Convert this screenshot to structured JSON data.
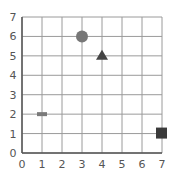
{
  "chart_data": {
    "type": "scatter",
    "title": "",
    "xlabel": "",
    "ylabel": "",
    "xlim": [
      0,
      7
    ],
    "ylim": [
      0,
      7
    ],
    "grid": true,
    "x_ticks": [
      "0",
      "1",
      "2",
      "3",
      "4",
      "5",
      "6",
      "7"
    ],
    "y_ticks": [
      "0",
      "1",
      "2",
      "3",
      "4",
      "5",
      "6",
      "7"
    ],
    "points": [
      {
        "shape": "rectangle-dash",
        "x": 1,
        "y": 2,
        "color": "#7a7a7a"
      },
      {
        "shape": "circle",
        "x": 3,
        "y": 6,
        "color": "#777777"
      },
      {
        "shape": "triangle",
        "x": 4,
        "y": 5,
        "color": "#444444"
      },
      {
        "shape": "square",
        "x": 7,
        "y": 1,
        "color": "#3a3a3a"
      }
    ]
  },
  "colors": {
    "grid": "#9a9a9a",
    "axis": "#555555",
    "tick_text": "#555555"
  }
}
